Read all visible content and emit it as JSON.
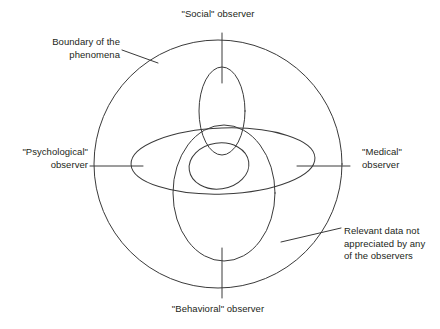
{
  "diagram": {
    "type": "venn-overlapping-ellipses",
    "background_color": "#ffffff",
    "stroke_color": "#3a3a3a",
    "text_color": "#231f20",
    "labels": {
      "social": "\"Social\" observer",
      "boundary": "Boundary of the\nphenomena",
      "psychological": "\"Psychological\"\nobserver",
      "medical": "\"Medical\"\nobserver",
      "relevant": "Relevant data not\nappreciated by any\nof the observers",
      "behavioral": "\"Behavioral\" observer"
    },
    "shapes": {
      "outer_circle": {
        "name": "boundary-of-the-phenomena",
        "cx": 218,
        "cy": 164,
        "r": 124
      },
      "social_ellipse": {
        "name": "social-observer-region",
        "cx": 222,
        "cy": 111,
        "rx": 23,
        "ry": 44,
        "rotate": 0
      },
      "psychological_ellipse": {
        "name": "psychological-observer-region",
        "cx": 223,
        "cy": 161,
        "rx": 92,
        "ry": 33,
        "rotate": -2
      },
      "behavioral_ellipse": {
        "name": "behavioral-observer-region",
        "cx": 224,
        "cy": 193,
        "rx": 51,
        "ry": 68,
        "rotate": 0
      },
      "medical_ellipse": {
        "name": "medical-observer-region",
        "cx": 219,
        "cy": 166,
        "rx": 30,
        "ry": 23,
        "rotate": -8
      }
    },
    "ticks": {
      "social": {
        "name": "social-observer-tick",
        "x1": 222,
        "y1": 33,
        "x2": 222,
        "y2": 83
      },
      "behavioral": {
        "name": "behavioral-observer-tick",
        "x1": 222,
        "y1": 248,
        "x2": 222,
        "y2": 298
      },
      "psychological": {
        "name": "psychological-observer-tick",
        "x1": 90,
        "y1": 166,
        "x2": 143,
        "y2": 166
      },
      "medical": {
        "name": "medical-observer-tick",
        "x1": 297,
        "y1": 166,
        "x2": 350,
        "y2": 166
      }
    },
    "leaders": {
      "boundary": {
        "name": "boundary-leader-line",
        "x1": 122,
        "y1": 50,
        "x2": 158,
        "y2": 63
      },
      "relevant": {
        "name": "relevant-data-leader-line",
        "x1": 281,
        "y1": 242,
        "x2": 341,
        "y2": 228
      }
    }
  }
}
